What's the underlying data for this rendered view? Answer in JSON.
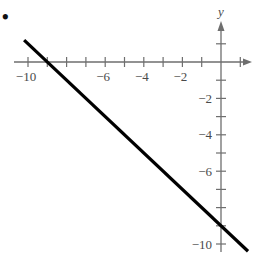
{
  "marker": {
    "bullet": "•"
  },
  "chart_data": {
    "type": "line",
    "title": "",
    "xlabel": "",
    "ylabel": "y",
    "xlim": [
      -10.5,
      1.5
    ],
    "ylim": [
      -11,
      2
    ],
    "grid": false,
    "legend": null,
    "x_ticks": [
      -10,
      -9,
      -8,
      -7,
      -6,
      -5,
      -4,
      -3,
      -2,
      -1,
      1
    ],
    "x_tick_labels": [
      {
        "value": -10,
        "label": "−10"
      },
      {
        "value": -6,
        "label": "−6"
      },
      {
        "value": -4,
        "label": "−4"
      },
      {
        "value": -2,
        "label": "−2"
      }
    ],
    "y_ticks": [
      1,
      -1,
      -2,
      -3,
      -4,
      -5,
      -6,
      -7,
      -8,
      -9,
      -10
    ],
    "y_tick_labels": [
      {
        "value": -2,
        "label": "−2"
      },
      {
        "value": -4,
        "label": "−4"
      },
      {
        "value": -6,
        "label": "−6"
      },
      {
        "value": -10,
        "label": "−10"
      }
    ],
    "series": [
      {
        "name": "y = -x - 9",
        "x": [
          -10.2,
          1.4
        ],
        "y": [
          1.2,
          -10.4
        ],
        "color": "#000000"
      }
    ],
    "annotations": [
      "x-intercept: (-9, 0)",
      "y-intercept: (0, -9)"
    ]
  }
}
